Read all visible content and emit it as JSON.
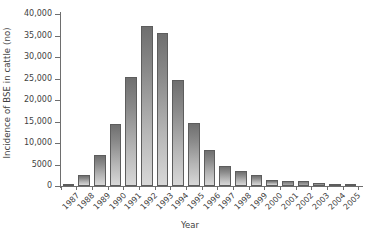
{
  "chart_data": {
    "type": "bar",
    "title": "",
    "subtitle": "",
    "xlabel": "Year",
    "ylabel": "Incidence of BSE in cattle (no)",
    "categories": [
      "1987",
      "1988",
      "1989",
      "1990",
      "1991",
      "1992",
      "1993",
      "1994",
      "1995",
      "1996",
      "1997",
      "1998",
      "1999",
      "2000",
      "2001",
      "2002",
      "2003",
      "2004",
      "2005"
    ],
    "values": [
      450,
      2500,
      7200,
      14400,
      25300,
      37200,
      35500,
      24600,
      14600,
      8400,
      4700,
      3600,
      2500,
      1400,
      1200,
      1100,
      600,
      350,
      220
    ],
    "series": [
      {
        "name": "Incidence of BSE in cattle",
        "values": [
          450,
          2500,
          7200,
          14400,
          25300,
          37200,
          35500,
          24600,
          14600,
          8400,
          4700,
          3600,
          2500,
          1400,
          1200,
          1100,
          600,
          350,
          220
        ]
      }
    ],
    "ylim": [
      0,
      40000
    ],
    "ytick_values": [
      0,
      5000,
      10000,
      15000,
      20000,
      25000,
      30000,
      35000,
      40000
    ],
    "ytick_labels": [
      "0",
      "5000",
      "10,000",
      "15,000",
      "20,000",
      "25,000",
      "30,000",
      "35,000",
      "40,000"
    ],
    "grid": false,
    "legend": false,
    "legend_position": "none",
    "bar_color": "#8a8a8a",
    "bar_edge_color": "#5d5d5d",
    "axis_color": "#6e6e6e",
    "text_color": "#3f3f3f",
    "background_color": "#ffffff",
    "xtick_label_rotation": -45
  }
}
